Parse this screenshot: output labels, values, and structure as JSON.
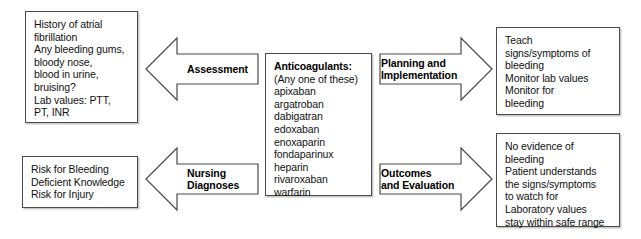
{
  "diagram": {
    "boxes": {
      "assessment_data": {
        "text": "History of atrial\nfibrillation\nAny bleeding gums,\nbloody nose,\nblood in urine,\nbruising?\nLab values: PTT,\nPT, INR"
      },
      "nursing_diagnoses_list": {
        "text": "Risk for Bleeding\nDeficient Knowledge\nRisk for Injury"
      },
      "medications": {
        "heading": "Anticoagulants:",
        "subheading": "(Any one of these)",
        "drugs": "apixaban\nargatroban\ndabigatran\nedoxaban\nenoxaparin\nfondaparinux\nheparin\nrivaroxaban\nwarfarin"
      },
      "planning_actions": {
        "text": "Teach\nsigns/symptoms of\nbleeding\nMonitor lab values\nMonitor for\nbleeding"
      },
      "outcomes_results": {
        "text": "No evidence of\nbleeding\nPatient understands\nthe signs/symptoms\nto watch for\nLaboratory values\nstay within safe range"
      }
    },
    "arrows": {
      "assessment": {
        "label": "Assessment",
        "direction": "left"
      },
      "nursing_diagnoses": {
        "label": "Nursing\nDiagnoses",
        "direction": "left"
      },
      "planning_implementation": {
        "label": "Planning and\nImplementation",
        "direction": "right"
      },
      "outcomes_evaluation": {
        "label": "Outcomes\nand Evaluation",
        "direction": "right"
      }
    },
    "colors": {
      "border": "#4a4a4a",
      "shadow": "#c9c9c9",
      "text": "#111111",
      "background": "#ffffff"
    }
  }
}
